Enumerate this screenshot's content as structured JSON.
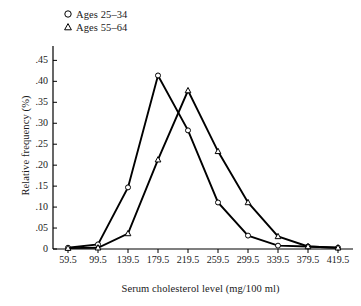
{
  "chart_data": {
    "type": "line",
    "title": "",
    "subtitle": "",
    "xlabel": "Serum cholesterol level (mg/100 ml)",
    "ylabel": "Relative frequency (%)",
    "x": [
      59.5,
      99.5,
      139.5,
      179.5,
      219.5,
      259.5,
      299.5,
      339.5,
      379.5,
      419.5
    ],
    "xtick_labels": [
      "59.5",
      "99.5",
      "139.5",
      "179.5",
      "219.5",
      "259.5",
      "299.5",
      "339.5",
      "379.5",
      "419.5"
    ],
    "ytick_labels": [
      "0",
      ".05",
      ".10",
      ".15",
      ".20",
      ".25",
      ".30",
      ".35",
      ".40",
      ".45"
    ],
    "ytick_values": [
      0,
      0.05,
      0.1,
      0.15,
      0.2,
      0.25,
      0.3,
      0.35,
      0.4,
      0.45
    ],
    "ylim": [
      0,
      0.47
    ],
    "xlim": [
      39.5,
      439.5
    ],
    "grid": false,
    "legend_position": "top-left-outside",
    "series": [
      {
        "name": "Ages 25–34",
        "marker": "circle",
        "values": [
          0.003,
          0.011,
          0.147,
          0.414,
          0.283,
          0.111,
          0.032,
          0.008,
          0.006,
          0.003
        ]
      },
      {
        "name": "Ages 55–64",
        "marker": "triangle",
        "values": [
          0.002,
          0.003,
          0.037,
          0.213,
          0.378,
          0.233,
          0.111,
          0.03,
          0.006,
          0.003
        ]
      }
    ],
    "line_color": "#000000",
    "marker_face_color": "#ffffff",
    "background_color": "#ffffff"
  },
  "legend": {
    "items": [
      {
        "label": "Ages 25–34",
        "marker": "circle-marker"
      },
      {
        "label": "Ages 55–64",
        "marker": "triangle-marker"
      }
    ]
  }
}
